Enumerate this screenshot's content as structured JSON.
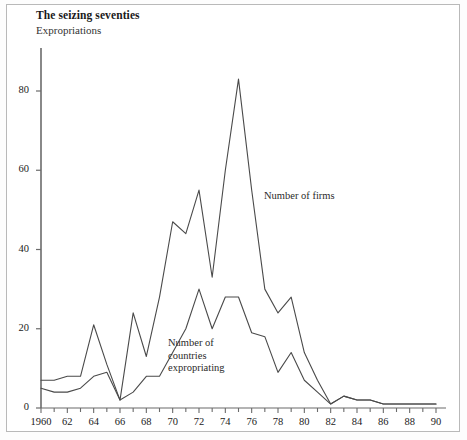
{
  "header": {
    "title": "The seizing seventies",
    "subtitle": "Expropriations"
  },
  "annotations": {
    "firms": "Number of firms",
    "countries_line1": "Number of",
    "countries_line2": "countries",
    "countries_line3": "expropriating"
  },
  "chart_data": {
    "type": "line",
    "title": "The seizing seventies",
    "subtitle": "Expropriations",
    "xlabel": "",
    "ylabel": "",
    "xlim": [
      1960,
      1990
    ],
    "ylim": [
      0,
      90
    ],
    "yticks": [
      0,
      20,
      40,
      60,
      80
    ],
    "ytick_labels": [
      "0",
      "20",
      "40",
      "60",
      "80"
    ],
    "xticks": [
      1960,
      1961,
      1962,
      1963,
      1964,
      1965,
      1966,
      1967,
      1968,
      1969,
      1970,
      1971,
      1972,
      1973,
      1974,
      1975,
      1976,
      1977,
      1978,
      1979,
      1980,
      1981,
      1982,
      1983,
      1984,
      1985,
      1986,
      1987,
      1988,
      1989,
      1990
    ],
    "xtick_labels": [
      "1960",
      "62",
      "64",
      "66",
      "68",
      "70",
      "72",
      "74",
      "76",
      "78",
      "80",
      "82",
      "84",
      "86",
      "88",
      "90"
    ],
    "xtick_label_years": [
      1960,
      1962,
      1964,
      1966,
      1968,
      1970,
      1972,
      1974,
      1976,
      1978,
      1980,
      1982,
      1984,
      1986,
      1988,
      1990
    ],
    "grid": false,
    "legend_position": "inline-annotations",
    "line_color": "#4a4a4a",
    "x": [
      1960,
      1961,
      1962,
      1963,
      1964,
      1965,
      1966,
      1967,
      1968,
      1969,
      1970,
      1971,
      1972,
      1973,
      1974,
      1975,
      1976,
      1977,
      1978,
      1979,
      1980,
      1981,
      1982,
      1983,
      1984,
      1985,
      1986,
      1987,
      1988,
      1989,
      1990
    ],
    "series": [
      {
        "name": "Number of firms",
        "values": [
          7,
          7,
          8,
          8,
          21,
          11,
          2,
          24,
          13,
          28,
          47,
          44,
          55,
          33,
          60,
          83,
          55,
          30,
          24,
          28,
          14,
          7,
          1,
          3,
          2,
          2,
          1,
          1,
          1,
          1,
          1
        ]
      },
      {
        "name": "Number of countries expropriating",
        "values": [
          5,
          4,
          4,
          5,
          8,
          9,
          2,
          4,
          8,
          8,
          14,
          20,
          30,
          20,
          28,
          28,
          19,
          18,
          9,
          14,
          7,
          4,
          1,
          3,
          2,
          2,
          1,
          1,
          1,
          1,
          1
        ]
      }
    ]
  }
}
